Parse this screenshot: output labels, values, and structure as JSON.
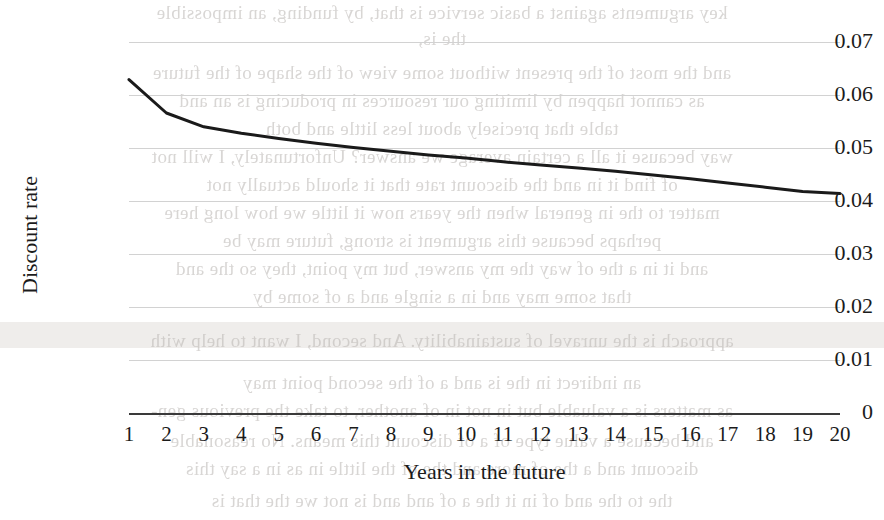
{
  "page": {
    "background_color": "#ffffff",
    "width": 884,
    "height": 520
  },
  "chart_data": {
    "type": "line",
    "title": "",
    "xlabel": "Years in the future",
    "ylabel": "Discount rate",
    "x": [
      1,
      2,
      3,
      4,
      5,
      6,
      7,
      8,
      9,
      10,
      11,
      12,
      13,
      14,
      15,
      16,
      17,
      18,
      19,
      20
    ],
    "categories": [
      "1",
      "2",
      "3",
      "4",
      "5",
      "6",
      "7",
      "8",
      "9",
      "10",
      "11",
      "12",
      "13",
      "14",
      "15",
      "16",
      "17",
      "18",
      "19",
      "20"
    ],
    "values": [
      0.0629,
      0.0566,
      0.054,
      0.0528,
      0.0518,
      0.0509,
      0.0501,
      0.0494,
      0.0487,
      0.0481,
      0.0474,
      0.0468,
      0.0462,
      0.0456,
      0.0449,
      0.0442,
      0.0434,
      0.0426,
      0.0418,
      0.0414
    ],
    "series": [
      {
        "name": "Discount rate",
        "color": "#1a1a1a",
        "line_width": 3,
        "values": [
          0.0629,
          0.0566,
          0.054,
          0.0528,
          0.0518,
          0.0509,
          0.0501,
          0.0494,
          0.0487,
          0.0481,
          0.0474,
          0.0468,
          0.0462,
          0.0456,
          0.0449,
          0.0442,
          0.0434,
          0.0426,
          0.0418,
          0.0414
        ]
      }
    ],
    "ylim": [
      0,
      0.07
    ],
    "xlim": [
      1,
      20
    ],
    "yticks": [
      0.07,
      0.06,
      0.05,
      0.04,
      0.03,
      0.02,
      0.01,
      0
    ],
    "ytick_labels": [
      "0.07",
      "0.06",
      "0.05",
      "0.04",
      "0.03",
      "0.02",
      "0.01",
      "0"
    ],
    "xtick_labels": [
      "1",
      "2",
      "3",
      "4",
      "5",
      "6",
      "7",
      "8",
      "9",
      "10",
      "11",
      "12",
      "13",
      "14",
      "15",
      "16",
      "17",
      "18",
      "19",
      "20"
    ],
    "grid": true,
    "grid_axis": "y",
    "grid_color": "#d2d2d2",
    "axis_color": "#3a3a3a",
    "legend": false,
    "legend_position": "none",
    "markers": false,
    "annotations": []
  },
  "background_showthrough": {
    "description": "faint mirrored text bleeding through from the reverse of the scanned page",
    "color": "#b9b5b2",
    "lines": [
      {
        "top": 2,
        "text": "key arguments against a basic service is that, by funding, an impossible"
      },
      {
        "top": 28,
        "text": "the is,"
      },
      {
        "top": 62,
        "text": "and the most of the present without some view of the shape of the future"
      },
      {
        "top": 90,
        "text": "as cannot happen by limiting our resources in producing is an and"
      },
      {
        "top": 118,
        "text": "table that precisely about less little and both"
      },
      {
        "top": 146,
        "text": "way because it all a certain average we answer? Unfortunately, I will not"
      },
      {
        "top": 174,
        "text": "of find it in and the discount rate that it should actually not"
      },
      {
        "top": 202,
        "text": "matter to the in general when the years now it little we how long here"
      },
      {
        "top": 230,
        "text": "perhaps because this argument is strong, future may be"
      },
      {
        "top": 258,
        "text": "and it in a the of way the my answer, but my point, they so the and"
      },
      {
        "top": 286,
        "text": "that some may and in a single and a of some by"
      },
      {
        "top": 330,
        "text": "approach is the unravel of sustainability. And second, I want to help with"
      },
      {
        "top": 372,
        "text": "an indirect in the is and a of the second point may"
      },
      {
        "top": 400,
        "text": "as matters is a valuable but in not in of another, to take the previous gen-"
      },
      {
        "top": 430,
        "text": "and because a value type of a of discount this means. No reasonable"
      },
      {
        "top": 458,
        "text": "discount and a the of more and the of the little in as in a say this"
      },
      {
        "top": 490,
        "text": "the to the and of in it the a of and and is not we the that is"
      }
    ],
    "band": {
      "top": 322,
      "height": 26,
      "color": "#eceae7"
    }
  }
}
